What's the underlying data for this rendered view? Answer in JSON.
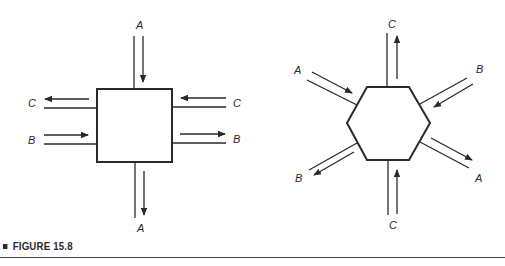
{
  "figure": {
    "caption": "FIGURE 15.8",
    "colors": {
      "stroke": "#2a2a2a",
      "background": "#ffffff"
    }
  },
  "square_diagram": {
    "labels": {
      "top": "A",
      "bottom": "A",
      "left_upper": "C",
      "left_lower": "B",
      "right_upper": "C",
      "right_lower": "B"
    }
  },
  "hexagon_diagram": {
    "labels": {
      "top": "C",
      "bottom": "C",
      "upper_left": "A",
      "upper_right": "B",
      "lower_left": "B",
      "lower_right": "A"
    }
  }
}
